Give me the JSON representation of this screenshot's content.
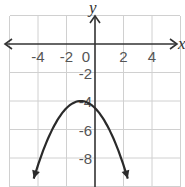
{
  "chart_data": {
    "type": "line",
    "title": "",
    "xlabel": "x",
    "ylabel": "y",
    "xlim": [
      -6.1,
      6.0
    ],
    "ylim": [
      -10,
      2
    ],
    "grid": true,
    "grid_step": 2,
    "x_ticks": [
      -4,
      -2,
      0,
      2,
      4
    ],
    "x_tick_labels": [
      "-4",
      "-2",
      "0",
      "2",
      "4"
    ],
    "y_ticks": [
      -2,
      -4,
      -6,
      -8
    ],
    "y_tick_labels": [
      "-2",
      "-4",
      "-6",
      "-8"
    ],
    "series": [
      {
        "name": "parabola",
        "equation": "y = -0.5(x + 1)^2 - 4",
        "vertex": [
          -1,
          -4
        ],
        "opens": "down",
        "arrows_on_ends": true,
        "x": [
          -4.3,
          -4,
          -3,
          -2,
          -1,
          0,
          1,
          2,
          2.3
        ],
        "y": [
          -9.4,
          -8.5,
          -6,
          -4.5,
          -4,
          -4.5,
          -6,
          -8.5,
          -9.4
        ]
      }
    ],
    "colors": {
      "grid": "#d0d0d0",
      "axis": "#333333",
      "curve": "#2a2a2a"
    }
  }
}
